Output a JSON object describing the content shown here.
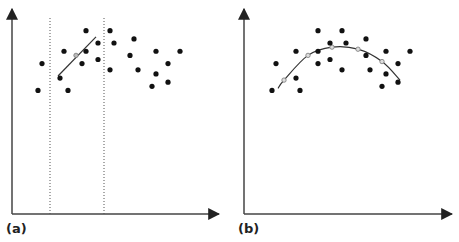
{
  "figure": {
    "line_color": "#333333",
    "point_color": "#111111",
    "marker_color": "#777777"
  },
  "chart_data": [
    {
      "type": "scatter",
      "panel_label": "(a)",
      "title": "",
      "xlabel": "",
      "ylabel": "",
      "xlim": [
        0,
        100
      ],
      "ylim": [
        0,
        100
      ],
      "window_bounds_x": [
        19,
        46
      ],
      "points": [
        {
          "x": 13,
          "y": 60
        },
        {
          "x": 15,
          "y": 73
        },
        {
          "x": 24,
          "y": 66
        },
        {
          "x": 26,
          "y": 79
        },
        {
          "x": 28,
          "y": 60
        },
        {
          "x": 35,
          "y": 73
        },
        {
          "x": 37,
          "y": 89
        },
        {
          "x": 37,
          "y": 79
        },
        {
          "x": 43,
          "y": 83
        },
        {
          "x": 43,
          "y": 75
        },
        {
          "x": 49,
          "y": 89
        },
        {
          "x": 49,
          "y": 70
        },
        {
          "x": 51,
          "y": 83
        },
        {
          "x": 59,
          "y": 77
        },
        {
          "x": 61,
          "y": 85
        },
        {
          "x": 63,
          "y": 70
        },
        {
          "x": 72,
          "y": 79
        },
        {
          "x": 72,
          "y": 68
        },
        {
          "x": 70,
          "y": 62
        },
        {
          "x": 78,
          "y": 73
        },
        {
          "x": 78,
          "y": 64
        },
        {
          "x": 84,
          "y": 79
        }
      ],
      "fit": {
        "kind": "linear-local",
        "line": [
          {
            "x": 23,
            "y": 67
          },
          {
            "x": 42,
            "y": 86
          }
        ],
        "markers": [
          {
            "x": 32,
            "y": 77
          }
        ]
      }
    },
    {
      "type": "scatter",
      "panel_label": "(b)",
      "title": "",
      "xlabel": "",
      "ylabel": "",
      "xlim": [
        0,
        100
      ],
      "ylim": [
        0,
        100
      ],
      "points": [
        {
          "x": 14,
          "y": 60
        },
        {
          "x": 16,
          "y": 73
        },
        {
          "x": 26,
          "y": 66
        },
        {
          "x": 26,
          "y": 79
        },
        {
          "x": 28,
          "y": 60
        },
        {
          "x": 37,
          "y": 73
        },
        {
          "x": 37,
          "y": 89
        },
        {
          "x": 37,
          "y": 79
        },
        {
          "x": 43,
          "y": 83
        },
        {
          "x": 43,
          "y": 75
        },
        {
          "x": 49,
          "y": 89
        },
        {
          "x": 49,
          "y": 70
        },
        {
          "x": 51,
          "y": 83
        },
        {
          "x": 61,
          "y": 77
        },
        {
          "x": 61,
          "y": 85
        },
        {
          "x": 63,
          "y": 70
        },
        {
          "x": 71,
          "y": 79
        },
        {
          "x": 71,
          "y": 68
        },
        {
          "x": 69,
          "y": 62
        },
        {
          "x": 77,
          "y": 73
        },
        {
          "x": 77,
          "y": 64
        },
        {
          "x": 83,
          "y": 79
        }
      ],
      "fit": {
        "kind": "smooth-curve",
        "curve": [
          {
            "x": 17,
            "y": 61
          },
          {
            "x": 20,
            "y": 65
          },
          {
            "x": 32,
            "y": 77
          },
          {
            "x": 44,
            "y": 81
          },
          {
            "x": 57,
            "y": 80
          },
          {
            "x": 69,
            "y": 74
          },
          {
            "x": 78,
            "y": 65
          }
        ],
        "markers": [
          {
            "x": 20,
            "y": 65
          },
          {
            "x": 32,
            "y": 77
          },
          {
            "x": 44,
            "y": 81
          },
          {
            "x": 57,
            "y": 80
          },
          {
            "x": 69,
            "y": 74
          }
        ]
      }
    }
  ]
}
